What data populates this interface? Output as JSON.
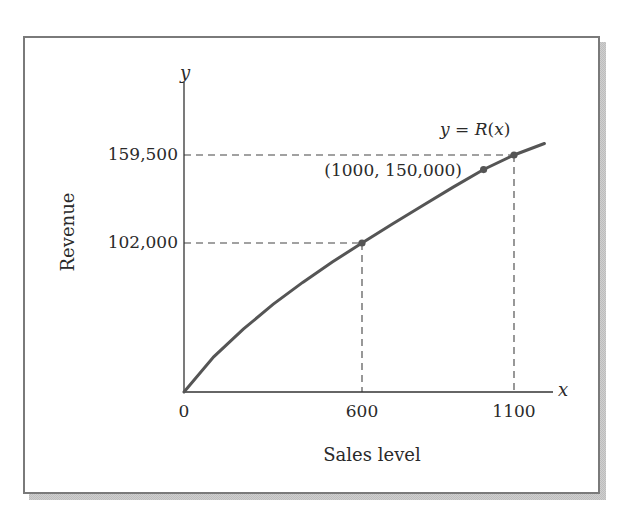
{
  "chart_data": {
    "type": "line",
    "title": "",
    "xlabel": "Sales level",
    "ylabel": "Revenue",
    "x_axis_var": "x",
    "y_axis_var": "y",
    "curve_label": "y = R(x)",
    "curve_label_parts": {
      "lhs": "y",
      "eq": " = ",
      "fn": "R",
      "open": "(",
      "arg": "x",
      "close": ")"
    },
    "x_tick_labels": [
      "0",
      "600",
      "1100"
    ],
    "x_ticks": [
      0,
      600,
      1100
    ],
    "y_tick_labels": [
      "102,000",
      "159,500"
    ],
    "y_ticks": [
      102000,
      159500
    ],
    "xlim": [
      0,
      1200
    ],
    "ylim": [
      0,
      190000
    ],
    "grid": false,
    "legend": "none",
    "series": [
      {
        "name": "R(x)",
        "x": [
          0,
          100,
          200,
          300,
          400,
          500,
          600,
          700,
          800,
          900,
          1000,
          1100,
          1200
        ],
        "values": [
          0,
          24000,
          43000,
          60000,
          75000,
          89000,
          102000,
          114500,
          126500,
          138500,
          150000,
          159500,
          167000
        ]
      }
    ],
    "highlighted_points": [
      {
        "x": 600,
        "y": 102000,
        "label": "",
        "guides": true
      },
      {
        "x": 1000,
        "y": 150000,
        "label": "(1000, 150,000)",
        "guides": false
      },
      {
        "x": 1100,
        "y": 159500,
        "label": "",
        "guides": true
      }
    ],
    "annotations": [
      "(1000, 150,000)",
      "y = R(x)"
    ]
  },
  "colors": {
    "curve": "#555555",
    "axis": "#333333",
    "guides": "#444444",
    "text": "#2a2a2a",
    "frame": "#7a7a7a"
  }
}
